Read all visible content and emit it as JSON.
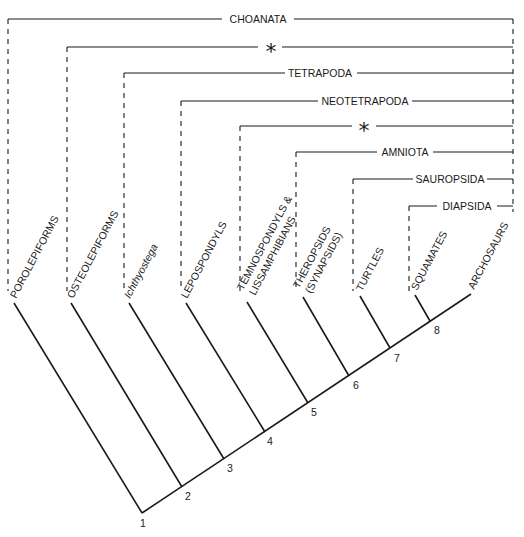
{
  "diagram": {
    "type": "cladogram",
    "clades": [
      {
        "label": "CHOANATA",
        "symbol": false
      },
      {
        "label": "*",
        "symbol": true
      },
      {
        "label": "TETRAPODA",
        "symbol": false
      },
      {
        "label": "NEOTETRAPODA",
        "symbol": false
      },
      {
        "label": "*",
        "symbol": true
      },
      {
        "label": "AMNIOTA",
        "symbol": false
      },
      {
        "label": "SAUROPSIDA",
        "symbol": false
      },
      {
        "label": "DIAPSIDA",
        "symbol": false
      }
    ],
    "taxa": [
      {
        "line1": "POROLEPIFORMS",
        "line2": "",
        "italic": false
      },
      {
        "line1": "OSTEOLEPIFORMS",
        "line2": "",
        "italic": false
      },
      {
        "line1": "Ichthyostega",
        "line2": "",
        "italic": true
      },
      {
        "line1": "LEPOSPONDYLS",
        "line2": "",
        "italic": false
      },
      {
        "line1": "TEMNOSPONDYLS &",
        "line2": "LISSAMPHIBIANS",
        "italic": false
      },
      {
        "line1": "THEROPSIDS",
        "line2": "(SYNAPSIDS)",
        "italic": false
      },
      {
        "line1": "TURTLES",
        "line2": "",
        "italic": false
      },
      {
        "line1": "SQUAMATES",
        "line2": "",
        "italic": false
      },
      {
        "line1": "ARCHOSAURS",
        "line2": "",
        "italic": false
      }
    ],
    "nodes": [
      "1",
      "2",
      "3",
      "4",
      "5",
      "6",
      "7",
      "8"
    ]
  }
}
